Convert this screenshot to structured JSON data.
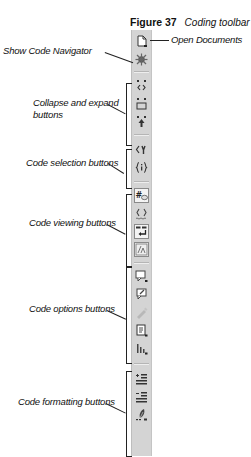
{
  "caption": {
    "figure": "Figure 37",
    "title": "Coding toolbar"
  },
  "toolbar": {
    "groups": [
      {
        "name": "top",
        "buttons": [
          {
            "icon": "open-documents-icon",
            "label": "Open Documents"
          },
          {
            "icon": "show-code-navigator-icon",
            "label": "Show Code Navigator"
          }
        ]
      },
      {
        "name": "collapse-expand",
        "buttons": [
          {
            "icon": "collapse-full-tag-icon"
          },
          {
            "icon": "collapse-selection-icon"
          },
          {
            "icon": "expand-all-icon"
          }
        ]
      },
      {
        "name": "code-selection",
        "buttons": [
          {
            "icon": "select-parent-tag-icon"
          },
          {
            "icon": "balance-braces-icon"
          }
        ]
      },
      {
        "name": "code-viewing",
        "buttons": [
          {
            "icon": "line-numbers-icon",
            "pressed": true
          },
          {
            "icon": "highlight-invalid-code-icon"
          },
          {
            "icon": "word-wrap-icon",
            "pressed": true
          },
          {
            "icon": "syntax-coloring-icon",
            "pressed": true
          }
        ]
      },
      {
        "name": "code-options",
        "buttons": [
          {
            "icon": "apply-comment-icon"
          },
          {
            "icon": "remove-comment-icon"
          },
          {
            "icon": "wrap-tag-icon",
            "disabled": true
          },
          {
            "icon": "recent-snippets-icon"
          },
          {
            "icon": "move-css-icon"
          }
        ]
      },
      {
        "name": "code-formatting",
        "buttons": [
          {
            "icon": "indent-code-icon"
          },
          {
            "icon": "outdent-code-icon"
          },
          {
            "icon": "format-source-code-icon"
          }
        ]
      }
    ]
  },
  "callouts": {
    "show_code_navigator": "Show Code Navigator",
    "open_documents": "Open Documents",
    "collapse_expand_line1": "Collapse and expand",
    "collapse_expand_line2": "buttons",
    "code_selection": "Code selection buttons",
    "code_viewing": "Code viewing buttons",
    "code_options": "Code options buttons",
    "code_formatting": "Code formatting buttons"
  },
  "colors": {
    "toolbar_bg": "#d4d4d4",
    "line": "#222222",
    "text": "#111111"
  }
}
